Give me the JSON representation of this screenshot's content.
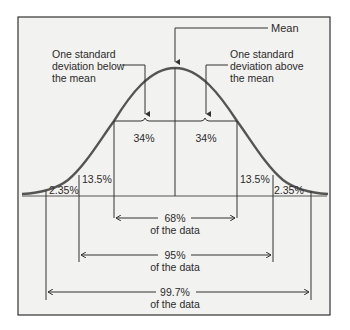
{
  "diagram": {
    "type": "normal-distribution-empirical-rule",
    "frame": {
      "background": "#f2f2f0",
      "border": "#333333"
    },
    "curve_color": "#555555",
    "annotations": {
      "mean": "Mean",
      "below": [
        "One standard",
        "deviation below",
        "the mean"
      ],
      "above": [
        "One standard",
        "deviation above",
        "the mean"
      ]
    },
    "regions": {
      "center_left": "34%",
      "center_right": "34%",
      "mid_left": "13.5%",
      "mid_right": "13.5%",
      "tail_left": "2.35%",
      "tail_right": "2.35%"
    },
    "ranges": [
      {
        "pct": "68%",
        "text": "of the data"
      },
      {
        "pct": "95%",
        "text": "of the data"
      },
      {
        "pct": "99.7%",
        "text": "of the data"
      }
    ]
  }
}
